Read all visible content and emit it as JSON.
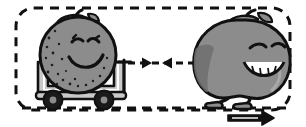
{
  "illustration": {
    "title": "Newton's third law cartoon: apple pulling orange in a wagon",
    "background_color": "#ffffff",
    "ink_color": "#111111",
    "body_fill": "#8c8c8c",
    "body_shadow": "#6e6e6e",
    "cart_fill": "#c9c9c9",
    "cart_shade": "#b0b0b0",
    "wheel_fill": "#1a1a1a",
    "wheel_hub": "#8c8c8c"
  },
  "border": {
    "name": "dashed-rounded-frame",
    "style": "dashed",
    "corner_radius": "18",
    "stroke_width": "3",
    "color": "#111111",
    "dash_pattern": "9 7"
  },
  "characters": [
    {
      "id": "orange-in-wagon",
      "label": "Orange riding in wagon",
      "fruit_type": "orange",
      "expression": "smiling, eyes closed",
      "has_stem": true,
      "has_leaf": true,
      "texture": "dotted peel",
      "position": "left",
      "state": "seated in cart, being pulled"
    },
    {
      "id": "apple-puller",
      "label": "Apple pulling the wagon",
      "fruit_type": "apple",
      "expression": "grinning with teeth, eyes closed",
      "has_stem": true,
      "has_leaf": true,
      "texture": "smooth with highlight",
      "position": "right",
      "state": "walking forward, arms pulling rope"
    }
  ],
  "vehicle": {
    "name": "wagon",
    "wheel_count": 2,
    "has_handle": true,
    "fill": "#c9c9c9"
  },
  "rope": {
    "name": "tow-rope",
    "color": "#111111",
    "style": "dashed",
    "attached_left": "wagon handle",
    "attached_right": "apple hands"
  },
  "force_arrows": [
    {
      "id": "force-on-wagon",
      "direction": "right",
      "meaning": "force exerted by apple on wagon",
      "style": "dashed",
      "color": "#111111"
    },
    {
      "id": "reaction-on-apple",
      "direction": "left",
      "meaning": "reaction force exerted by wagon on apple",
      "style": "dashed",
      "color": "#111111"
    }
  ],
  "motion_arrow": {
    "id": "direction-of-motion",
    "direction": "right",
    "style": "solid outlined block arrow",
    "color": "#111111",
    "location": "bottom right, below ground line"
  },
  "ground": {
    "name": "ground-line",
    "style": "dashed",
    "color": "#111111"
  }
}
